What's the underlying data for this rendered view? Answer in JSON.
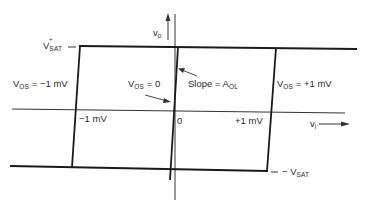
{
  "diagram": {
    "type": "op-amp transfer characteristic (voltage transfer curve)",
    "axes": {
      "vertical": {
        "label": "v",
        "label_sub": "o"
      },
      "horizontal": {
        "label": "v",
        "label_sub": "i"
      }
    },
    "saturation": {
      "positive": {
        "label": "V",
        "label_sup": "+",
        "label_sub": "SAT"
      },
      "negative": {
        "label": "− V",
        "label_sub": "SAT"
      }
    },
    "x_ticks": [
      {
        "label": "−1 mV"
      },
      {
        "label": "0"
      },
      {
        "label": "+1 mV"
      }
    ],
    "curves": [
      {
        "label": "V",
        "label_sub": "OS",
        "label_rest": " = −1 mV"
      },
      {
        "label": "V",
        "label_sub": "OS",
        "label_rest": " = 0"
      },
      {
        "label": "V",
        "label_sub": "OS",
        "label_rest": " = +1 mV"
      }
    ],
    "annotation": {
      "label": "Slope = A",
      "label_sub": "OL"
    },
    "colors": {
      "line": "#1a1a1a",
      "background": "#ffffff"
    }
  }
}
